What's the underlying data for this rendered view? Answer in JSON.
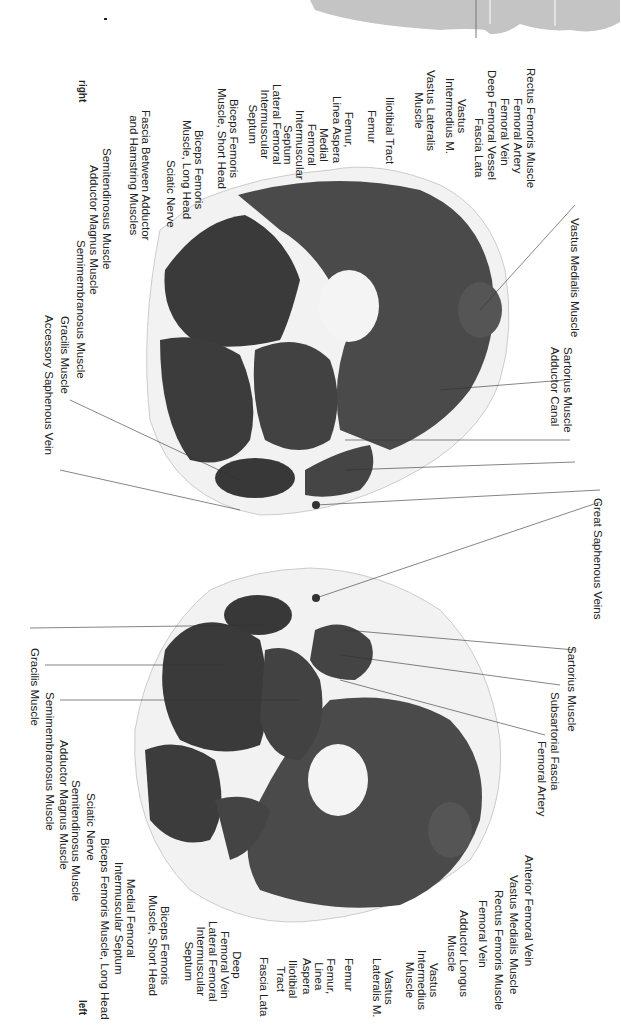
{
  "orientation": {
    "right": "right",
    "left": "left"
  },
  "upper_section": {
    "labels": [
      {
        "x": 581,
        "y": 218,
        "text": "Vastus Medialis Muscle"
      },
      {
        "x": 574,
        "y": 347,
        "text": "Sartorius Muscle"
      },
      {
        "x": 561,
        "y": 347,
        "text": "Adductor Canal"
      },
      {
        "x": 537,
        "y": 68,
        "text": "Rectus Femoris Muscle"
      },
      {
        "x": 524,
        "y": 98,
        "text": "Femoral Artery"
      },
      {
        "x": 511,
        "y": 98,
        "text": "Femoral Vein"
      },
      {
        "x": 498,
        "y": 70,
        "text": "Deep Femoral Vessel"
      },
      {
        "x": 485,
        "y": 118,
        "text": "Fascia Lata"
      },
      {
        "x": 468,
        "y": 78,
        "text": "Vastus\nIntermedius M."
      },
      {
        "x": 437,
        "y": 70,
        "text": "Vastus Lateralis\nMuscle"
      },
      {
        "x": 396,
        "y": 97,
        "text": "Iliotibial Tract"
      },
      {
        "x": 378,
        "y": 110,
        "text": "Femur"
      },
      {
        "x": 355,
        "y": 96,
        "text": "Femur,\nLinea Aspera"
      },
      {
        "x": 330,
        "y": 110,
        "text": "Medial\nFemoral\nIntermuscular\nSeptum"
      },
      {
        "x": 283,
        "y": 84,
        "text": "Lateral Femoral\nIntermuscular\nSeptum"
      },
      {
        "x": 240,
        "y": 88,
        "text": "Biceps Femoris\nMuscle, Short Head"
      },
      {
        "x": 205,
        "y": 120,
        "text": "Biceps Femoris\nMuscle, Long Head"
      },
      {
        "x": 177,
        "y": 160,
        "text": "Sciatic Nerve"
      },
      {
        "x": 152,
        "y": 110,
        "text": "Fascia Between Adductor\nand Hamstring Muscles"
      },
      {
        "x": 113,
        "y": 148,
        "text": "Semitendinosus Muscle"
      },
      {
        "x": 100,
        "y": 165,
        "text": "Adductor Magnus Muscle"
      },
      {
        "x": 87,
        "y": 240,
        "text": "Semimembranosus Muscle"
      },
      {
        "x": 71,
        "y": 316,
        "text": "Gracilis Muscle"
      },
      {
        "x": 55,
        "y": 315,
        "text": "Accessory Saphenous Vein"
      }
    ]
  },
  "center_label": {
    "x": 604,
    "y": 498,
    "text": "Great Saphenous Veins"
  },
  "lower_section": {
    "labels": [
      {
        "x": 578,
        "y": 646,
        "text": "Sartorius Muscle"
      },
      {
        "x": 561,
        "y": 692,
        "text": "Subsartorial Fascia"
      },
      {
        "x": 548,
        "y": 741,
        "text": "Femoral Artery"
      },
      {
        "x": 41,
        "y": 648,
        "text": "Gracilis Muscle"
      },
      {
        "x": 56,
        "y": 692,
        "text": "Semimembranosus Muscle"
      },
      {
        "x": 70,
        "y": 740,
        "text": "Adductor Magnus Muscle"
      },
      {
        "x": 82,
        "y": 780,
        "text": "Semitendinosus Muscle"
      },
      {
        "x": 97,
        "y": 793,
        "text": "Sciatic Nerve"
      },
      {
        "x": 111,
        "y": 838,
        "text": "Biceps Femoris Muscle, Long Head"
      },
      {
        "x": 137,
        "y": 862,
        "text": "Medial Femoral\nIntermuscular Septum"
      },
      {
        "x": 171,
        "y": 895,
        "text": "Biceps Femoris\nMuscle, Short Head"
      },
      {
        "x": 219,
        "y": 921,
        "text": "Lateral Femoral\nIntermuscular\nSeptum"
      },
      {
        "x": 243,
        "y": 931,
        "text": "Deep\nFemoral Vein"
      },
      {
        "x": 270,
        "y": 957,
        "text": "Fascia Lata"
      },
      {
        "x": 299,
        "y": 960,
        "text": "Iliotibial\nTract"
      },
      {
        "x": 337,
        "y": 958,
        "text": "Femur,\nLinea\nAspera"
      },
      {
        "x": 355,
        "y": 958,
        "text": "Femur"
      },
      {
        "x": 395,
        "y": 958,
        "text": "Vastus\nLateralis M."
      },
      {
        "x": 440,
        "y": 950,
        "text": "Vastus\nIntermedius\nMuscle"
      },
      {
        "x": 470,
        "y": 910,
        "text": "Adductor Longus\nMuscle"
      },
      {
        "x": 489,
        "y": 900,
        "text": "Femoral Vein"
      },
      {
        "x": 505,
        "y": 890,
        "text": "Rectus Femoris Muscle"
      },
      {
        "x": 520,
        "y": 875,
        "text": "Vastus Medialis Muscle"
      },
      {
        "x": 535,
        "y": 855,
        "text": "Anterior Femoral Vein"
      }
    ]
  }
}
